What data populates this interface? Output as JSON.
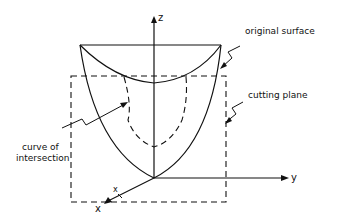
{
  "diagram": {
    "labels": {
      "original_surface": "original surface",
      "cutting_plane": "cutting plane",
      "curve_of_intersection_line1": "curve of",
      "curve_of_intersection_line2": "intersection"
    },
    "axes": {
      "z": "z",
      "y": "y",
      "x": "x",
      "x_marker": "x"
    },
    "colors": {
      "ink": "#111111",
      "background": "#ffffff"
    }
  }
}
